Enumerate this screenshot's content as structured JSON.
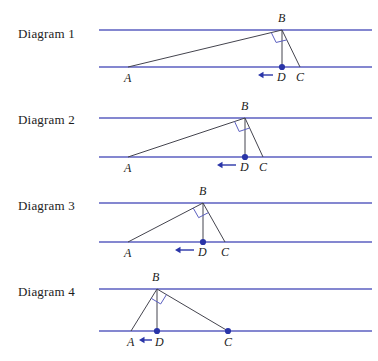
{
  "figure": {
    "width": 378,
    "height": 361,
    "colors": {
      "parallel_line": "#5b5fc0",
      "triangle_side": "#44444e",
      "marker_dot": "#2a35a8",
      "arrow": "#2a35a8",
      "right_angle_mark": "#5b5fc0",
      "background": "#ffffff",
      "text": "#1c1c1c"
    }
  },
  "panels": [
    {
      "id": "diagram-1",
      "label": "Diagram 1",
      "label_x": 18,
      "label_y": 26,
      "top_line": {
        "x1": 99,
        "y1": 30,
        "x2": 372,
        "y2": 30
      },
      "bottom_line": {
        "x1": 99,
        "y1": 67,
        "x2": 372,
        "y2": 67
      },
      "points": {
        "A": {
          "x": 128,
          "y": 67
        },
        "B": {
          "x": 282,
          "y": 30
        },
        "C": {
          "x": 300,
          "y": 67
        },
        "D": {
          "x": 282,
          "y": 67
        }
      },
      "labels": {
        "A": {
          "text": "A",
          "x": 124,
          "y": 82
        },
        "B": {
          "text": "B",
          "x": 278,
          "y": 22
        },
        "C": {
          "text": "C",
          "x": 296,
          "y": 81
        },
        "D": {
          "text": "D",
          "x": 277,
          "y": 81
        }
      },
      "right_angle_size": 11,
      "arrow": {
        "x_tip": 258,
        "x_tail": 273,
        "y": 75
      },
      "dots": [
        "D"
      ]
    },
    {
      "id": "diagram-2",
      "label": "Diagram 2",
      "label_x": 18,
      "label_y": 112,
      "top_line": {
        "x1": 99,
        "y1": 118,
        "x2": 372,
        "y2": 118
      },
      "bottom_line": {
        "x1": 99,
        "y1": 157,
        "x2": 372,
        "y2": 157
      },
      "points": {
        "A": {
          "x": 128,
          "y": 157
        },
        "B": {
          "x": 245,
          "y": 118
        },
        "C": {
          "x": 263,
          "y": 157
        },
        "D": {
          "x": 245,
          "y": 157
        }
      },
      "labels": {
        "A": {
          "text": "A",
          "x": 124,
          "y": 172
        },
        "B": {
          "text": "B",
          "x": 241,
          "y": 110
        },
        "C": {
          "text": "C",
          "x": 259,
          "y": 171
        },
        "D": {
          "text": "D",
          "x": 240,
          "y": 171
        }
      },
      "right_angle_size": 11,
      "arrow": {
        "x_tip": 217,
        "x_tail": 236,
        "y": 165
      },
      "dots": [
        "D"
      ]
    },
    {
      "id": "diagram-3",
      "label": "Diagram 3",
      "label_x": 18,
      "label_y": 198,
      "top_line": {
        "x1": 99,
        "y1": 203,
        "x2": 372,
        "y2": 203
      },
      "bottom_line": {
        "x1": 99,
        "y1": 242,
        "x2": 372,
        "y2": 242
      },
      "points": {
        "A": {
          "x": 128,
          "y": 242
        },
        "B": {
          "x": 203,
          "y": 203
        },
        "C": {
          "x": 225,
          "y": 242
        },
        "D": {
          "x": 203,
          "y": 242
        }
      },
      "labels": {
        "A": {
          "text": "A",
          "x": 124,
          "y": 257
        },
        "B": {
          "text": "B",
          "x": 199,
          "y": 195
        },
        "C": {
          "text": "C",
          "x": 221,
          "y": 256
        },
        "D": {
          "text": "D",
          "x": 198,
          "y": 256
        }
      },
      "right_angle_size": 11,
      "arrow": {
        "x_tip": 175,
        "x_tail": 194,
        "y": 250
      },
      "dots": [
        "D"
      ]
    },
    {
      "id": "diagram-4",
      "label": "Diagram 4",
      "label_x": 18,
      "label_y": 284,
      "top_line": {
        "x1": 99,
        "y1": 289,
        "x2": 372,
        "y2": 289
      },
      "bottom_line": {
        "x1": 99,
        "y1": 331,
        "x2": 372,
        "y2": 331
      },
      "points": {
        "A": {
          "x": 131,
          "y": 331
        },
        "B": {
          "x": 157,
          "y": 289
        },
        "C": {
          "x": 228,
          "y": 331
        },
        "D": {
          "x": 157,
          "y": 331
        }
      },
      "labels": {
        "A": {
          "text": "A",
          "x": 127,
          "y": 346
        },
        "B": {
          "text": "B",
          "x": 152,
          "y": 281
        },
        "C": {
          "text": "C",
          "x": 224,
          "y": 346
        },
        "D": {
          "text": "D",
          "x": 155,
          "y": 346
        }
      },
      "right_angle_size": 11,
      "arrow": {
        "x_tip": 139,
        "x_tail": 152,
        "y": 340
      },
      "dots": [
        "D",
        "C"
      ]
    }
  ]
}
